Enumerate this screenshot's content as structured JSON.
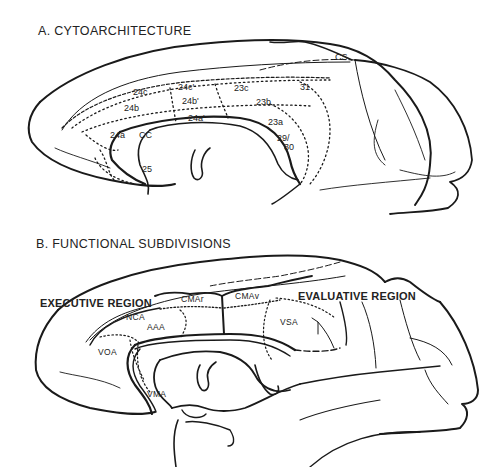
{
  "panels": [
    {
      "id": "A",
      "title": "A. CYTOARCHITECTURE",
      "labels": {
        "cs": "CS",
        "a24c": "24c",
        "a24c_prime": "24c'",
        "a23c": "23c",
        "a31": "31",
        "a24b": "24b",
        "a24b_prime": "24b'",
        "a23b": "23b",
        "a24a_prime": "24a'",
        "a23a": "23a",
        "a24a": "24a",
        "cc": "CC",
        "a29_30_top": "29/",
        "a29_30_bottom": "30",
        "a25": "25"
      }
    },
    {
      "id": "B",
      "title": "B. FUNCTIONAL SUBDIVISIONS",
      "regions": {
        "executive": "EXECUTIVE REGION",
        "evaluative": "EVALUATIVE REGION"
      },
      "labels": {
        "cmar": "CMAr",
        "cmav": "CMAv",
        "nca": "NCA",
        "aaa": "AAA",
        "vsa": "VSA",
        "voa": "VOA",
        "vma": "VMA"
      }
    }
  ],
  "colors": {
    "ink": "#1a1a1a",
    "background": "#ffffff"
  }
}
